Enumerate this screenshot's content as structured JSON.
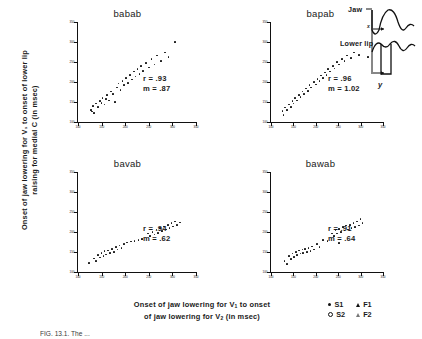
{
  "figure": {
    "ylabel_line1": "Onset of jaw lowering for V₁ to onset of lower lip",
    "ylabel_line2": "raising for medial C (in msec)",
    "xlabel_line1": "Onset of jaw lowering for V₁ to onset",
    "xlabel_line2": "of jaw lowering for V₂ (in msec)",
    "caption": "FIG. 13.1.   The ...",
    "axis_color": "#111111"
  },
  "inset": {
    "jaw_label": "Jaw",
    "lowerlip_label": "Lower lip",
    "x_label": "x",
    "y_label": "y"
  },
  "legend": {
    "items": [
      {
        "symbol": "filled-circle",
        "label": "S1"
      },
      {
        "symbol": "filled-triangle",
        "label": "F1"
      },
      {
        "symbol": "open-circle",
        "label": "S2"
      },
      {
        "symbol": "open-triangle",
        "label": "F2"
      }
    ]
  },
  "chart_data": [
    {
      "type": "scatter",
      "title": "babab",
      "xlabel": "Onset of jaw lowering for V1 to onset of jaw lowering for V2 (in msec)",
      "ylabel": "Onset of jaw lowering for V1 to onset of lower lip raising for medial C (in msec)",
      "xlim": [
        100,
        350
      ],
      "ylim": [
        100,
        350
      ],
      "xticks": [
        100,
        150,
        200,
        250,
        300,
        350
      ],
      "yticks": [
        100,
        150,
        200,
        250,
        300,
        350
      ],
      "annotations": {
        "r": "r = .93",
        "m": "m = .87"
      },
      "r": 0.93,
      "slope": 0.87,
      "grid": false,
      "points": [
        [
          128,
          130
        ],
        [
          130,
          126
        ],
        [
          132,
          140
        ],
        [
          134,
          122
        ],
        [
          138,
          146
        ],
        [
          142,
          138
        ],
        [
          146,
          152
        ],
        [
          150,
          148
        ],
        [
          152,
          160
        ],
        [
          156,
          144
        ],
        [
          160,
          158
        ],
        [
          162,
          168
        ],
        [
          166,
          154
        ],
        [
          170,
          176
        ],
        [
          174,
          170
        ],
        [
          178,
          150
        ],
        [
          182,
          186
        ],
        [
          186,
          196
        ],
        [
          190,
          180
        ],
        [
          194,
          202
        ],
        [
          198,
          192
        ],
        [
          202,
          210
        ],
        [
          206,
          198
        ],
        [
          210,
          218
        ],
        [
          214,
          206
        ],
        [
          218,
          226
        ],
        [
          222,
          214
        ],
        [
          226,
          232
        ],
        [
          230,
          220
        ],
        [
          234,
          240
        ],
        [
          238,
          228
        ],
        [
          244,
          248
        ],
        [
          250,
          236
        ],
        [
          256,
          258
        ],
        [
          262,
          244
        ],
        [
          268,
          266
        ],
        [
          276,
          252
        ],
        [
          284,
          274
        ],
        [
          292,
          262
        ],
        [
          306,
          300
        ]
      ]
    },
    {
      "type": "scatter",
      "title": "bapab",
      "xlim": [
        100,
        350
      ],
      "ylim": [
        100,
        350
      ],
      "xticks": [
        100,
        150,
        200,
        250,
        300,
        350
      ],
      "yticks": [
        100,
        150,
        200,
        250,
        300,
        350
      ],
      "annotations": {
        "r": "r = .96",
        "m": "m = 1.02"
      },
      "r": 0.96,
      "slope": 1.02,
      "grid": false,
      "points": [
        [
          126,
          128
        ],
        [
          128,
          118
        ],
        [
          132,
          136
        ],
        [
          136,
          130
        ],
        [
          140,
          144
        ],
        [
          144,
          138
        ],
        [
          148,
          152
        ],
        [
          150,
          146
        ],
        [
          154,
          160
        ],
        [
          158,
          154
        ],
        [
          162,
          168
        ],
        [
          166,
          162
        ],
        [
          170,
          176
        ],
        [
          174,
          170
        ],
        [
          178,
          184
        ],
        [
          182,
          178
        ],
        [
          186,
          192
        ],
        [
          190,
          186
        ],
        [
          196,
          200
        ],
        [
          200,
          194
        ],
        [
          204,
          208
        ],
        [
          208,
          202
        ],
        [
          212,
          216
        ],
        [
          216,
          210
        ],
        [
          220,
          224
        ],
        [
          224,
          218
        ],
        [
          228,
          232
        ],
        [
          232,
          226
        ],
        [
          238,
          240
        ],
        [
          242,
          234
        ],
        [
          248,
          250
        ],
        [
          252,
          244
        ],
        [
          258,
          258
        ],
        [
          264,
          252
        ],
        [
          270,
          266
        ],
        [
          278,
          260
        ],
        [
          286,
          274
        ],
        [
          296,
          268
        ],
        [
          316,
          262
        ]
      ]
    },
    {
      "type": "scatter",
      "title": "bavab",
      "xlim": [
        100,
        350
      ],
      "ylim": [
        100,
        350
      ],
      "xticks": [
        100,
        150,
        200,
        250,
        300,
        350
      ],
      "yticks": [
        100,
        150,
        200,
        250,
        300,
        350
      ],
      "annotations": {
        "r": "r = .94",
        "m": "m = .62"
      },
      "r": 0.94,
      "slope": 0.62,
      "grid": false,
      "points": [
        [
          124,
          122
        ],
        [
          134,
          134
        ],
        [
          138,
          128
        ],
        [
          142,
          142
        ],
        [
          146,
          136
        ],
        [
          150,
          148
        ],
        [
          154,
          140
        ],
        [
          156,
          152
        ],
        [
          160,
          144
        ],
        [
          164,
          154
        ],
        [
          168,
          148
        ],
        [
          172,
          158
        ],
        [
          176,
          150
        ],
        [
          180,
          162
        ],
        [
          184,
          156
        ],
        [
          188,
          166
        ],
        [
          192,
          160
        ],
        [
          198,
          170
        ],
        [
          204,
          174
        ],
        [
          212,
          176
        ],
        [
          220,
          178
        ],
        [
          228,
          180
        ],
        [
          236,
          182
        ],
        [
          248,
          196
        ],
        [
          252,
          190
        ],
        [
          258,
          200
        ],
        [
          262,
          194
        ],
        [
          266,
          206
        ],
        [
          270,
          198
        ],
        [
          274,
          210
        ],
        [
          278,
          202
        ],
        [
          282,
          214
        ],
        [
          286,
          206
        ],
        [
          290,
          218
        ],
        [
          294,
          210
        ],
        [
          298,
          222
        ],
        [
          302,
          214
        ],
        [
          306,
          226
        ],
        [
          310,
          218
        ],
        [
          316,
          224
        ]
      ]
    },
    {
      "type": "scatter",
      "title": "bawab",
      "xlim": [
        100,
        350
      ],
      "ylim": [
        100,
        350
      ],
      "xticks": [
        100,
        150,
        200,
        250,
        300,
        350
      ],
      "yticks": [
        100,
        150,
        200,
        250,
        300,
        350
      ],
      "annotations": {
        "r": "r = .91",
        "m": "m = .64"
      },
      "r": 0.91,
      "slope": 0.64,
      "grid": false,
      "points": [
        [
          130,
          128
        ],
        [
          136,
          120
        ],
        [
          140,
          140
        ],
        [
          144,
          132
        ],
        [
          148,
          146
        ],
        [
          152,
          138
        ],
        [
          156,
          150
        ],
        [
          158,
          142
        ],
        [
          162,
          154
        ],
        [
          166,
          146
        ],
        [
          170,
          156
        ],
        [
          172,
          148
        ],
        [
          176,
          158
        ],
        [
          180,
          150
        ],
        [
          184,
          160
        ],
        [
          188,
          152
        ],
        [
          192,
          164
        ],
        [
          196,
          156
        ],
        [
          202,
          170
        ],
        [
          208,
          162
        ],
        [
          216,
          180
        ],
        [
          226,
          178
        ],
        [
          236,
          196
        ],
        [
          240,
          190
        ],
        [
          244,
          204
        ],
        [
          248,
          196
        ],
        [
          252,
          208
        ],
        [
          256,
          200
        ],
        [
          260,
          212
        ],
        [
          264,
          204
        ],
        [
          268,
          216
        ],
        [
          272,
          206
        ],
        [
          276,
          218
        ],
        [
          280,
          210
        ],
        [
          284,
          222
        ],
        [
          288,
          212
        ],
        [
          292,
          226
        ],
        [
          296,
          216
        ],
        [
          300,
          232
        ],
        [
          304,
          222
        ],
        [
          252,
          172
        ]
      ]
    }
  ]
}
